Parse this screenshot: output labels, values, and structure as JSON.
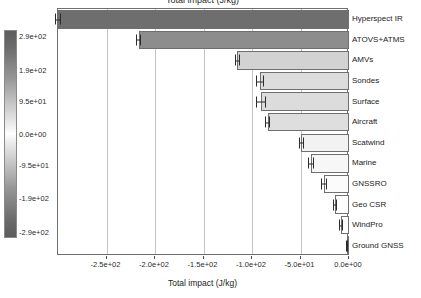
{
  "chart_data": {
    "type": "bar",
    "orientation": "horizontal",
    "title": "Total impact (J/kg)",
    "xlabel": "Total impact (J/kg)",
    "ylabel": "",
    "xlim": [
      -300,
      0
    ],
    "grid": true,
    "categories": [
      "Hyperspect IR",
      "ATOVS+ATMS",
      "AMVs",
      "Sondes",
      "Surface",
      "Aircraft",
      "Scatwind",
      "Marine",
      "GNSSRO",
      "Geo CSR",
      "WindPro",
      "Ground GNSS"
    ],
    "values": [
      -300,
      -217,
      -115,
      -92,
      -91,
      -84,
      -49,
      -39,
      -26,
      -14,
      -8,
      -2
    ],
    "errors": [
      3,
      3,
      3,
      4,
      5,
      3,
      3,
      3,
      3,
      2,
      2,
      1
    ],
    "xticks": [
      -250,
      -200,
      -150,
      -100,
      -50,
      0
    ],
    "xticklabels": [
      "-2.5e+02",
      "-2.0e+02",
      "-1.5e+02",
      "-1.0e+02",
      "-5.0e+01",
      "0.0e+00"
    ],
    "colorbar": {
      "ticks": [
        290,
        190,
        95,
        0,
        -95,
        -190,
        -290
      ],
      "ticklabels": [
        "2.9e+02",
        "1.9e+02",
        "9.5e+01",
        "0.0e+00",
        "-9.5e+01",
        "-1.9e+02",
        "-2.9e+02"
      ],
      "tick_positions_pct": [
        3,
        19,
        34,
        50,
        65,
        81,
        97
      ],
      "cmap_high": "#5d5d5d",
      "cmap_mid": "#ffffff",
      "cmap_low": "#5b5b5b"
    },
    "bar_colors": [
      "#6e6e6e",
      "#8d8d8d",
      "#d2d2d2",
      "#dcdcdc",
      "#dcdcdc",
      "#dedede",
      "#f2f2f2",
      "#f7f7f7",
      "#fbfbfb",
      "#fdfdfd",
      "#fefefe",
      "#ffffff"
    ],
    "edge_color": "#6f6f6f",
    "grid_color": "#c4c4c4",
    "error_color": "#2b2b2b"
  }
}
